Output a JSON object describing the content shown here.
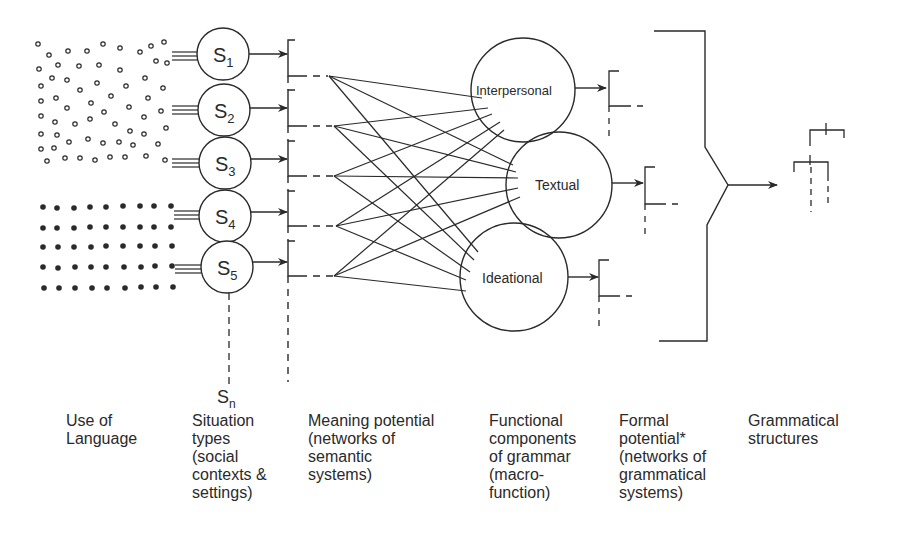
{
  "diagram": {
    "situations": [
      {
        "label": "S",
        "sub": "1"
      },
      {
        "label": "S",
        "sub": "2"
      },
      {
        "label": "S",
        "sub": "3"
      },
      {
        "label": "S",
        "sub": "4"
      },
      {
        "label": "S",
        "sub": "5"
      }
    ],
    "situation_n": {
      "label": "S",
      "sub": "n"
    },
    "components": {
      "interpersonal": "Interpersonal",
      "textual": "Textual",
      "ideational": "Ideational"
    }
  },
  "column_labels": {
    "use_of_language": "Use of\nLanguage",
    "situation_types": "Situation\ntypes\n(social\ncontexts &\nsettings)",
    "meaning_potential": "Meaning potential\n(networks of\nsemantic\nsystems)",
    "functional_components": "Functional\ncomponents\nof grammar\n(macro-\nfunction)",
    "formal_potential": "Formal\npotential*\n(networks of\ngrammatical\nsystems)",
    "grammatical_structures": "Grammatical\nstructures"
  },
  "colors": {
    "ink": "#2a2a2a",
    "background": "#ffffff"
  }
}
